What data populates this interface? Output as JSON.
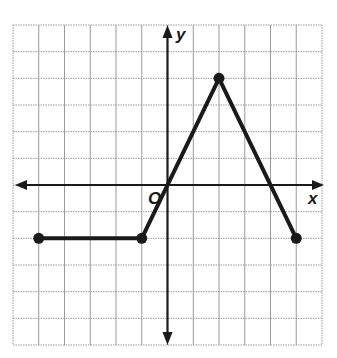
{
  "chart_data": {
    "type": "line",
    "title": "",
    "xlabel": "x",
    "ylabel": "y",
    "origin_label": "O",
    "xlim": [
      -6,
      6
    ],
    "ylim": [
      -6,
      6
    ],
    "grid": true,
    "grid_step": 1,
    "tick_labels": false,
    "series": [
      {
        "name": "piecewise function",
        "points": [
          [
            -5,
            -2
          ],
          [
            -1,
            -2
          ],
          [
            2,
            4
          ],
          [
            5,
            -2
          ]
        ],
        "closed_endpoints": [
          [
            -5,
            -2
          ],
          [
            -1,
            -2
          ],
          [
            2,
            4
          ],
          [
            5,
            -2
          ]
        ],
        "color": "#1a1a1a"
      }
    ]
  },
  "colors": {
    "grid": "#9a9a9a",
    "axis": "#1a1a1a",
    "line": "#1a1a1a",
    "background": "#ffffff"
  }
}
